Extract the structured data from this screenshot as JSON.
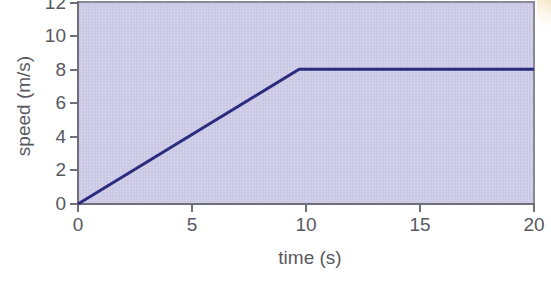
{
  "chart_data": {
    "type": "line",
    "title": "",
    "xlabel": "time (s)",
    "ylabel": "speed (m/s)",
    "xlim": [
      0,
      20
    ],
    "ylim": [
      0,
      12
    ],
    "xticks": [
      "0",
      "5",
      "10",
      "15",
      "20"
    ],
    "yticks": [
      "0",
      "2",
      "4",
      "6",
      "8",
      "10",
      "12"
    ],
    "xtick_values": [
      0,
      5,
      10,
      15,
      20
    ],
    "ytick_values": [
      0,
      2,
      4,
      6,
      8,
      10,
      12
    ],
    "grid": false,
    "legend": null,
    "series": [
      {
        "name": "speed",
        "x": [
          0,
          9.7,
          20
        ],
        "y": [
          0,
          8,
          8
        ],
        "color": "#2c2c7e",
        "line_width": 3,
        "description": "Speed increases linearly from 0 m/s at 0 s to 8 m/s at about 10 s, then stays constant at 8 m/s until 20 s."
      }
    ],
    "plot_background_color": "#c9c7e4",
    "axis_color": "#6f6f7c",
    "tick_label_color": "#58585f",
    "figure_background_color": "#ffffff"
  },
  "axes": {
    "x_title": "time (s)",
    "y_title": "speed (m/s)",
    "x_tick_labels": [
      "0",
      "5",
      "10",
      "15",
      "20"
    ],
    "y_tick_labels": [
      "0",
      "2",
      "4",
      "6",
      "8",
      "10",
      "12"
    ]
  }
}
